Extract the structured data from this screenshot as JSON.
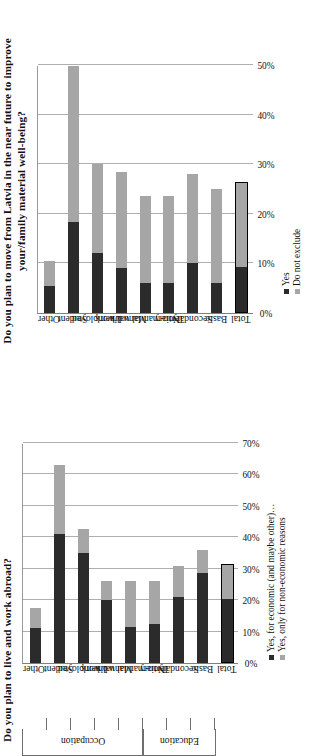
{
  "charts": [
    {
      "id": "move-from-latvia",
      "title": "Do you plan to move from Latvia in the near future to improve your/family material well-being?",
      "legend": [
        {
          "label": "Yes",
          "color": "#2b2b2b"
        },
        {
          "label": "Do not exclude",
          "color": "#a6a6a6"
        }
      ],
      "ticks": [
        "0%",
        "10%",
        "20%",
        "30%",
        "40%",
        "50%"
      ],
      "chart_data": {
        "type": "bar",
        "orientation": "horizontal",
        "stacked": true,
        "title": "Do you plan to move from Latvia in the near future to improve your/family material well-being?",
        "xlabel": "",
        "ylabel": "",
        "xlim": [
          0,
          50
        ],
        "grid": true,
        "legend_position": "bottom-right",
        "categories": [
          "Other",
          "Student",
          "Unemployed",
          "Manual work",
          "Non-manual work",
          "Tertiary",
          "Secondary",
          "Basic",
          "Total"
        ],
        "series": [
          {
            "name": "Yes",
            "color": "#2b2b2b",
            "values": [
              5.5,
              18.5,
              12.0,
              9.0,
              6.0,
              6.0,
              10.0,
              6.0,
              9.0
            ]
          },
          {
            "name": "Do not exclude",
            "color": "#a6a6a6",
            "values": [
              5.0,
              31.5,
              18.0,
              19.5,
              17.5,
              17.5,
              18.0,
              19.0,
              17.0
            ]
          }
        ],
        "totals": [
          10.5,
          50.0,
          30.0,
          28.5,
          23.5,
          23.5,
          28.0,
          25.0,
          26.0
        ]
      }
    },
    {
      "id": "live-and-work-abroad",
      "title": "Do you plan to live and work abroad?",
      "legend": [
        {
          "label": "Yes, for economic (and maybe other)…",
          "color": "#2b2b2b"
        },
        {
          "label": "Yes, only for non-economic reasons",
          "color": "#a6a6a6"
        }
      ],
      "ticks": [
        "0%",
        "10%",
        "20%",
        "30%",
        "40%",
        "50%",
        "60%",
        "70%"
      ],
      "groups": [
        {
          "label": "Occupation",
          "categories": [
            "Other",
            "Student",
            "Unemployed",
            "Manual work",
            "Non-manual work"
          ]
        },
        {
          "label": "Education",
          "categories": [
            "Tertiary",
            "Secondary",
            "Basic"
          ]
        }
      ],
      "chart_data": {
        "type": "bar",
        "orientation": "horizontal",
        "stacked": true,
        "title": "Do you plan to live and work abroad?",
        "xlabel": "",
        "ylabel": "",
        "xlim": [
          0,
          70
        ],
        "grid": true,
        "legend_position": "bottom",
        "categories": [
          "Other",
          "Student",
          "Unemployed",
          "Manual work",
          "Non-manual work",
          "Tertiary",
          "Secondary",
          "Basic",
          "Total"
        ],
        "series": [
          {
            "name": "Yes, for economic (and maybe other)…",
            "color": "#2b2b2b",
            "values": [
              11.0,
              41.0,
              35.0,
              20.0,
              11.5,
              12.5,
              21.0,
              28.5,
              20.0
            ]
          },
          {
            "name": "Yes, only for non-economic reasons",
            "color": "#a6a6a6",
            "values": [
              6.5,
              22.0,
              7.5,
              6.0,
              14.5,
              13.5,
              10.0,
              7.5,
              11.0
            ]
          }
        ],
        "totals": [
          17.5,
          63.0,
          42.5,
          26.0,
          26.0,
          26.0,
          31.0,
          36.0,
          31.0
        ]
      }
    }
  ]
}
